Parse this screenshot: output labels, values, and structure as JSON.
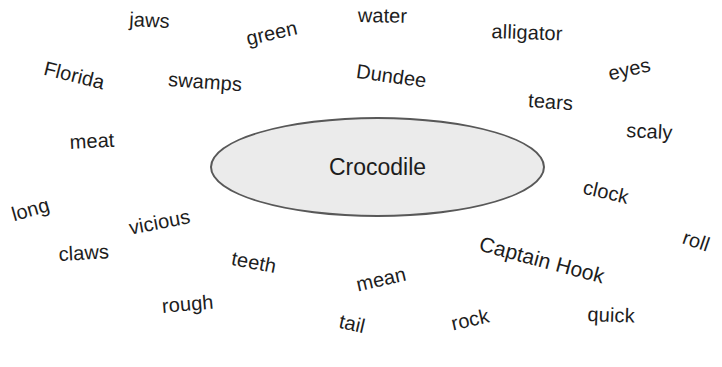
{
  "diagram": {
    "type": "word-web",
    "background_color": "#ffffff",
    "text_color": "#1d1d1d",
    "center": {
      "label": "Crocodile",
      "shape": "ellipse",
      "fill_color": "#ebebeb",
      "border_color": "#585858",
      "x": 210,
      "y": 117,
      "width": 335,
      "height": 100,
      "font_size": 23
    },
    "words": [
      {
        "label": "jaws",
        "x": 130,
        "y": 8,
        "rotation": 3,
        "font_size": 20
      },
      {
        "label": "green",
        "x": 244,
        "y": 28,
        "rotation": -13,
        "font_size": 20
      },
      {
        "label": "water",
        "x": 358,
        "y": 4,
        "rotation": 1,
        "font_size": 20
      },
      {
        "label": "alligator",
        "x": 492,
        "y": 20,
        "rotation": 2,
        "font_size": 20
      },
      {
        "label": "eyes",
        "x": 606,
        "y": 63,
        "rotation": -13,
        "font_size": 20
      },
      {
        "label": "Florida",
        "x": 47,
        "y": 57,
        "rotation": 14,
        "font_size": 20
      },
      {
        "label": "swamps",
        "x": 169,
        "y": 68,
        "rotation": 4,
        "font_size": 20
      },
      {
        "label": "Dundee",
        "x": 358,
        "y": 60,
        "rotation": 8,
        "font_size": 20
      },
      {
        "label": "tears",
        "x": 529,
        "y": 89,
        "rotation": 4,
        "font_size": 20
      },
      {
        "label": "scaly",
        "x": 627,
        "y": 119,
        "rotation": 3,
        "font_size": 20
      },
      {
        "label": "meat",
        "x": 69,
        "y": 131,
        "rotation": -3,
        "font_size": 20
      },
      {
        "label": "long",
        "x": 9,
        "y": 204,
        "rotation": -16,
        "font_size": 20
      },
      {
        "label": "vicious",
        "x": 127,
        "y": 217,
        "rotation": -11,
        "font_size": 20
      },
      {
        "label": "clock",
        "x": 586,
        "y": 176,
        "rotation": 13,
        "font_size": 20
      },
      {
        "label": "claws",
        "x": 58,
        "y": 243,
        "rotation": -3,
        "font_size": 20
      },
      {
        "label": "teeth",
        "x": 234,
        "y": 247,
        "rotation": 11,
        "font_size": 20
      },
      {
        "label": "mean",
        "x": 354,
        "y": 274,
        "rotation": -13,
        "font_size": 20
      },
      {
        "label": "Captain Hook",
        "x": 483,
        "y": 232,
        "rotation": 15,
        "font_size": 21
      },
      {
        "label": "roll",
        "x": 687,
        "y": 226,
        "rotation": 19,
        "font_size": 20
      },
      {
        "label": "rough",
        "x": 161,
        "y": 295,
        "rotation": -5,
        "font_size": 20
      },
      {
        "label": "tail",
        "x": 342,
        "y": 310,
        "rotation": 13,
        "font_size": 20
      },
      {
        "label": "rock",
        "x": 449,
        "y": 313,
        "rotation": -13,
        "font_size": 20
      },
      {
        "label": "quick",
        "x": 588,
        "y": 303,
        "rotation": 2,
        "font_size": 20
      }
    ]
  }
}
